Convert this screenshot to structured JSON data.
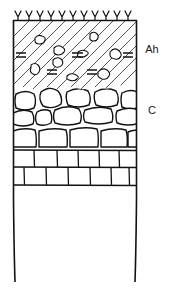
{
  "figure": {
    "name": "soil-profile-diagram",
    "background_color": "#ffffff",
    "line_color": "#1a1a1a"
  },
  "labels": {
    "ah": "Ah",
    "c": "C"
  },
  "horizons": [
    {
      "code": "Ah",
      "name": "humus-topsoil-horizon",
      "pattern": "diagonal-hatching-with-stones",
      "top_px": 20,
      "bottom_px": 90,
      "fill": "#ffffff",
      "hatch_color": "#1a1a1a"
    },
    {
      "code": "C",
      "name": "weathered-rock-horizon",
      "pattern": "irregular-boulders",
      "top_px": 90,
      "bottom_px": 148,
      "fill": "#ffffff"
    },
    {
      "code": "R",
      "name": "bedrock-layer",
      "pattern": "rectangular-blocks",
      "top_px": 148,
      "bottom_px": 186,
      "fill": "#ffffff"
    }
  ],
  "surface": {
    "name": "vegetation-tick-marks",
    "count": 11,
    "symbol": "Y",
    "y_px": 20
  },
  "frame": {
    "left_px": 13,
    "right_px": 137,
    "top_px": 20,
    "bottom_px": 283
  },
  "ah_markings": {
    "stones": [
      {
        "x": 38,
        "y": 38,
        "w": 9,
        "h": 7
      },
      {
        "x": 93,
        "y": 35,
        "w": 8,
        "h": 8
      },
      {
        "x": 57,
        "y": 48,
        "w": 10,
        "h": 7
      },
      {
        "x": 81,
        "y": 53,
        "w": 10,
        "h": 6
      },
      {
        "x": 113,
        "y": 53,
        "w": 10,
        "h": 9
      },
      {
        "x": 33,
        "y": 66,
        "w": 8,
        "h": 10
      },
      {
        "x": 56,
        "y": 60,
        "w": 9,
        "h": 9
      },
      {
        "x": 70,
        "y": 76,
        "w": 10,
        "h": 6
      },
      {
        "x": 101,
        "y": 73,
        "w": 11,
        "h": 9
      }
    ],
    "equals_marks": [
      {
        "x": 20,
        "y": 55
      },
      {
        "x": 77,
        "y": 55
      },
      {
        "x": 127,
        "y": 55
      },
      {
        "x": 52,
        "y": 72
      },
      {
        "x": 92,
        "y": 72
      }
    ]
  }
}
